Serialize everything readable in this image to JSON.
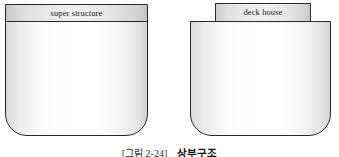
{
  "figure": {
    "caption_tag": "[그림 2-24]",
    "caption_title": "상부구조",
    "diagrams": [
      {
        "id": "superstructure",
        "label": "super structure",
        "description": "hull cross-section with full-width superstructure band on top"
      },
      {
        "id": "deckhouse",
        "label": "deck house",
        "description": "hull cross-section with a narrower deck house box on top"
      }
    ]
  },
  "colors": {
    "outline": "#2a2a2a",
    "band_fill": "#e9e9e9",
    "body_fill": "#ffffff",
    "background": "#ffffff",
    "caption_text": "#141414"
  }
}
